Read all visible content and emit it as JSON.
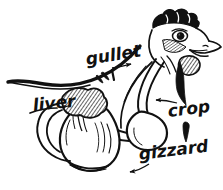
{
  "figure": {
    "style": "pen-and-ink line drawing",
    "background_color": "#ffffff",
    "ink_color": "#111111",
    "width": 223,
    "height": 190
  },
  "labels": {
    "gullet": "gullet",
    "liver": "liver",
    "crop": "crop",
    "gizzard": "gizzard"
  },
  "callouts": [
    {
      "name": "gullet",
      "text": "gullet",
      "text_x": 86,
      "text_y": 60,
      "font_size": 17,
      "rotation": -9,
      "arrow_from_x": 112,
      "arrow_from_y": 68,
      "arrow_to_x": 131,
      "arrow_to_y": 64,
      "organ": "esophagus"
    },
    {
      "name": "liver",
      "text": "liver",
      "text_x": 33,
      "text_y": 106,
      "font_size": 17,
      "rotation": -6,
      "arrow_from_x": 0,
      "arrow_from_y": 0,
      "arrow_to_x": 0,
      "arrow_to_y": 0,
      "organ": "liver"
    },
    {
      "name": "crop",
      "text": "crop",
      "text_x": 168,
      "text_y": 112,
      "font_size": 17,
      "rotation": -7,
      "arrow_from_x": 177,
      "arrow_from_y": 103,
      "arrow_to_x": 156,
      "arrow_to_y": 100,
      "organ": "crop"
    },
    {
      "name": "gizzard",
      "text": "gizzard",
      "text_x": 139,
      "text_y": 155,
      "font_size": 17,
      "rotation": -7,
      "arrow_from_x": 147,
      "arrow_from_y": 166,
      "arrow_to_x": 130,
      "arrow_to_y": 172,
      "organ": "gizzard"
    }
  ],
  "anatomy_parts": [
    "comb",
    "eye",
    "beak",
    "wattle",
    "neck",
    "back-line",
    "gullet",
    "crop",
    "liver",
    "gizzard",
    "intestine"
  ]
}
